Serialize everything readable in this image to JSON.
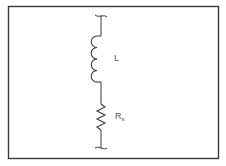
{
  "diagram": {
    "type": "circuit-schematic",
    "colors": {
      "frame": "#3a3a3a",
      "wire": "#3a3a3a",
      "label": "#555555",
      "background": "#ffffff"
    },
    "components": [
      {
        "id": "inductor",
        "symbol": "coil",
        "label": "L"
      },
      {
        "id": "resistor",
        "symbol": "zigzag",
        "label_main": "R",
        "label_sub": "s"
      }
    ],
    "terminals": [
      "top-terminal",
      "bottom-terminal"
    ]
  }
}
